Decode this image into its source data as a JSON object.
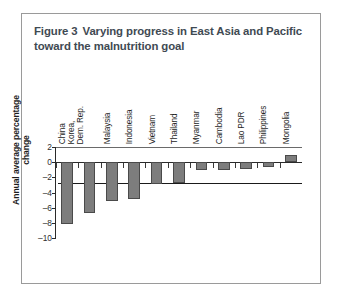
{
  "figure": {
    "label": "Figure 3",
    "title": "Varying progress in East Asia and Pacific toward the malnutrition goal",
    "title_line1": "Varying progress in East Asia and Pacific",
    "title_line2": "toward the malnutrition goal",
    "title_color": "#3f4a53",
    "border_color": "#9a9a9a"
  },
  "chart_data": {
    "type": "bar",
    "xlabel": "",
    "ylabel": "Annual average percentage change",
    "ylim": [
      -10,
      2
    ],
    "yticks": [
      2,
      0,
      -2,
      -4,
      -6,
      -8,
      -10
    ],
    "ytick_labels": [
      "2",
      "0",
      "-2",
      "-4",
      "-6",
      "-8",
      "-10"
    ],
    "grid": false,
    "legend": "none",
    "bar_color": "#7d7d7d",
    "bar_edge_color": "#4a4a4a",
    "reference_line": {
      "value": -2.7,
      "color": "#1a1a1a",
      "label": ""
    },
    "categories": [
      "China",
      "Korea, Dem. Rep.",
      "Malaysia",
      "Indonesia",
      "Vietnam",
      "Thailand",
      "Myanmar",
      "Cambodia",
      "Lao PDR",
      "Philippines",
      "Mongolia"
    ],
    "category_lines": [
      [
        "China"
      ],
      [
        "Korea,",
        "Dem. Rep."
      ],
      [
        "Malaysia"
      ],
      [
        "Indonesia"
      ],
      [
        "Vietnam"
      ],
      [
        "Thailand"
      ],
      [
        "Myanmar"
      ],
      [
        "Cambodia"
      ],
      [
        "Lao PDR"
      ],
      [
        "Philippines"
      ],
      [
        "Mongolia"
      ]
    ],
    "values": [
      -8.2,
      -6.7,
      -5.1,
      -4.8,
      -2.9,
      -2.7,
      -1.1,
      -1.1,
      -0.9,
      -0.6,
      1.0
    ]
  }
}
